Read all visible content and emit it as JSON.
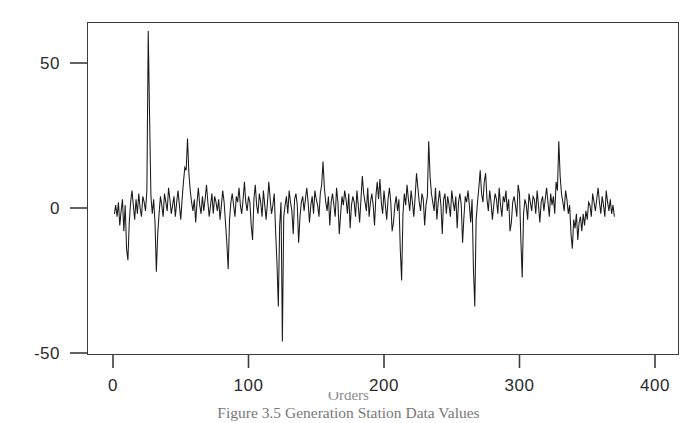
{
  "figure": {
    "caption": "Figure 3.5 Generation Station Data Values",
    "x_axis_title": "Orders"
  },
  "chart_data": {
    "type": "line",
    "title": "",
    "subtitle": "",
    "xlabel": "",
    "ylabel": "",
    "xlim": [
      0,
      400
    ],
    "ylim": [
      -50,
      62
    ],
    "grid": false,
    "legend": null,
    "xticks": [
      0,
      100,
      200,
      300,
      400
    ],
    "xtick_labels": [
      "0",
      "100",
      "200",
      "300",
      "400"
    ],
    "yticks": [
      50,
      0,
      -50
    ],
    "ytick_labels": [
      "50",
      "0",
      "-50"
    ],
    "series": [
      {
        "name": "residual",
        "color": "#1a1a1a",
        "x_start": 1,
        "x_step": 1,
        "values": [
          -2,
          1,
          -3,
          2,
          -6,
          -1,
          3,
          -8,
          1,
          -14,
          -18,
          -5,
          2,
          6,
          1,
          -4,
          3,
          -2,
          5,
          0,
          -3,
          4,
          2,
          -1,
          6,
          61,
          31,
          4,
          -2,
          3,
          -5,
          -22,
          -9,
          -2,
          4,
          1,
          -3,
          5,
          2,
          -1,
          7,
          3,
          -2,
          1,
          4,
          -3,
          2,
          6,
          1,
          -4,
          3,
          9,
          14,
          13,
          24,
          12,
          6,
          2,
          -1,
          3,
          -5,
          2,
          7,
          1,
          -2,
          4,
          -1,
          3,
          8,
          2,
          -3,
          1,
          5,
          -2,
          4,
          2,
          -1,
          3,
          -4,
          1,
          6,
          2,
          -5,
          -12,
          -21,
          -4,
          2,
          5,
          1,
          -3,
          4,
          2,
          7,
          1,
          -2,
          3,
          9,
          2,
          -1,
          4,
          2,
          -6,
          -11,
          3,
          8,
          1,
          -2,
          5,
          2,
          -3,
          6,
          1,
          -4,
          2,
          9,
          3,
          -2,
          1,
          5,
          -8,
          -19,
          -34,
          -6,
          2,
          -46,
          -3,
          1,
          4,
          -2,
          6,
          2,
          -1,
          -9,
          3,
          5,
          1,
          -12,
          -3,
          2,
          4,
          -1,
          3,
          7,
          2,
          -5,
          1,
          4,
          -2,
          6,
          3,
          1,
          -3,
          5,
          8,
          16,
          7,
          2,
          -1,
          4,
          -6,
          2,
          5,
          1,
          -3,
          7,
          2,
          -9,
          -2,
          4,
          1,
          6,
          3,
          -2,
          5,
          -7,
          1,
          4,
          2,
          -3,
          6,
          1,
          -5,
          3,
          11,
          5,
          2,
          -1,
          7,
          -3,
          2,
          5,
          1,
          -6,
          4,
          9,
          3,
          10,
          2,
          -2,
          6,
          1,
          -4,
          3,
          7,
          2,
          -8,
          -5,
          1,
          4,
          -1,
          3,
          -14,
          -25,
          -2,
          5,
          1,
          8,
          3,
          -1,
          6,
          2,
          -3,
          4,
          12,
          7,
          2,
          -1,
          5,
          3,
          -6,
          1,
          4,
          23,
          11,
          5,
          2,
          -1,
          7,
          -4,
          2,
          6,
          1,
          -9,
          3,
          5,
          -2,
          4,
          1,
          -3,
          6,
          2,
          -1,
          4,
          -7,
          2,
          5,
          1,
          -12,
          -3,
          4,
          2,
          6,
          1,
          -5,
          3,
          -21,
          -34,
          -4,
          2,
          7,
          13,
          5,
          2,
          9,
          12,
          3,
          -1,
          6,
          2,
          -4,
          1,
          5,
          3,
          -2,
          7,
          1,
          -3,
          4,
          2,
          6,
          -1,
          3,
          -8,
          -5,
          2,
          4,
          1,
          -3,
          8,
          5,
          -11,
          -24,
          -2,
          3,
          1,
          -4,
          5,
          2,
          -1,
          4,
          3,
          -2,
          6,
          1,
          -5,
          2,
          4,
          -1,
          3,
          7,
          2,
          -3,
          5,
          1,
          4,
          -2,
          9,
          6,
          23,
          11,
          5,
          2,
          -1,
          6,
          3,
          -2,
          1,
          -9,
          -14,
          -4,
          -7,
          -2,
          -11,
          -5,
          -3,
          -8,
          -2,
          -6,
          -1,
          -4,
          2,
          1,
          -3,
          5,
          2,
          -1,
          3,
          7,
          2,
          -2,
          4,
          1,
          -3,
          6,
          2,
          -1,
          3,
          -2,
          1,
          -3
        ]
      }
    ]
  },
  "axis": {
    "y_ticks": [
      "50",
      "0",
      "-50"
    ],
    "x_ticks": [
      "0",
      "100",
      "200",
      "300",
      "400"
    ]
  }
}
